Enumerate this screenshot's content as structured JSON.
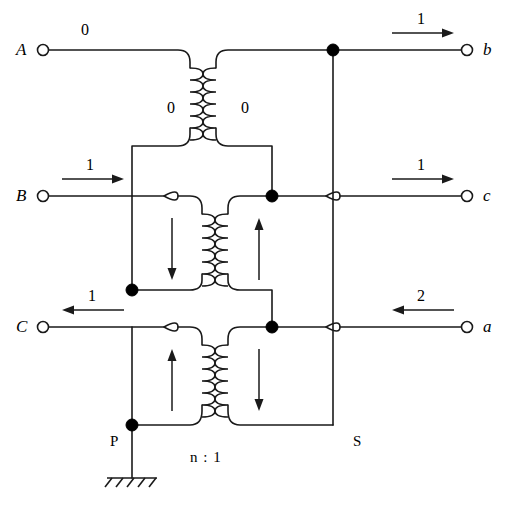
{
  "diagram": {
    "type": "three-phase-transformer-circuit",
    "turns_ratio": "n : 1",
    "primary_side_label": "P",
    "secondary_side_label": "S"
  },
  "primary_terminals": [
    {
      "id": "A",
      "label": "A",
      "current": "0",
      "arrow": "none",
      "y": 50
    },
    {
      "id": "B",
      "label": "B",
      "current": "1",
      "arrow": "right",
      "y": 196
    },
    {
      "id": "C",
      "label": "C",
      "current": "1",
      "arrow": "left",
      "y": 327
    }
  ],
  "secondary_terminals": [
    {
      "id": "b",
      "label": "b",
      "current": "1",
      "arrow": "right",
      "y": 50
    },
    {
      "id": "c",
      "label": "c",
      "current": "1",
      "arrow": "right",
      "y": 196
    },
    {
      "id": "a",
      "label": "a",
      "current": "2",
      "arrow": "left",
      "y": 327
    }
  ],
  "transformers": [
    {
      "name": "top-transformer",
      "primary_label": "0",
      "secondary_label": "0",
      "primary_arrow": "none",
      "secondary_arrow": "none"
    },
    {
      "name": "middle-transformer",
      "primary_label": "",
      "secondary_label": "",
      "primary_arrow": "down",
      "secondary_arrow": "up"
    },
    {
      "name": "bottom-transformer",
      "primary_label": "",
      "secondary_label": "",
      "primary_arrow": "up",
      "secondary_arrow": "down"
    }
  ],
  "colors": {
    "wire": "#1a1a1a",
    "node": "#000000",
    "background": "#ffffff"
  }
}
